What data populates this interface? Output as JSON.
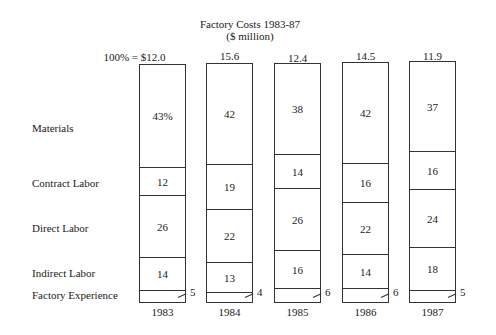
{
  "chart_data": {
    "type": "bar",
    "subtype": "100% stacked bar",
    "title": "Factory Costs 1983-87",
    "subtitle": "($ million)",
    "categories": [
      "1983",
      "1984",
      "1985",
      "1986",
      "1987"
    ],
    "totals_label_prefix": "100% = $",
    "totals": [
      12.0,
      15.6,
      12.4,
      14.5,
      11.9
    ],
    "totals_text": [
      "100% = $12.0",
      "15.6",
      "12.4",
      "14.5",
      "11.9"
    ],
    "series": [
      {
        "name": "Materials",
        "values": [
          43,
          42,
          38,
          42,
          37
        ]
      },
      {
        "name": "Contract Labor",
        "values": [
          12,
          19,
          14,
          16,
          16
        ]
      },
      {
        "name": "Direct Labor",
        "values": [
          26,
          22,
          26,
          22,
          24
        ]
      },
      {
        "name": "Indirect Labor",
        "values": [
          14,
          13,
          16,
          14,
          18
        ]
      },
      {
        "name": "Factory Experience",
        "values": [
          5,
          4,
          6,
          6,
          5
        ]
      }
    ],
    "value_labels": [
      [
        "43%",
        "12",
        "26",
        "14",
        "5"
      ],
      [
        "42",
        "19",
        "22",
        "13",
        "4"
      ],
      [
        "38",
        "14",
        "26",
        "16",
        "6"
      ],
      [
        "42",
        "16",
        "22",
        "14",
        "6"
      ],
      [
        "37",
        "16",
        "24",
        "18",
        "5"
      ]
    ],
    "ylim": [
      0,
      100
    ],
    "grid": false,
    "legend": "row labels on left"
  },
  "labels": {
    "title": "Factory Costs 1983-87",
    "subtitle": "($ million)",
    "rows": [
      "Materials",
      "Contract Labor",
      "Direct Labor",
      "Indirect Labor",
      "Factory Experience"
    ]
  }
}
